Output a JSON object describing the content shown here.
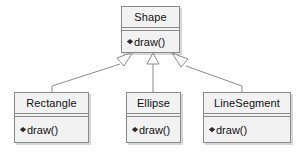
{
  "diagram": {
    "type": "uml-class-diagram",
    "relationship_label": "generalization",
    "colors": {
      "box_fill": "#f2f2f2",
      "box_border": "#8a8a8a",
      "line": "#8a8a8a",
      "text": "#111111",
      "background": "#ffffff",
      "arrowhead_fill": "#ffffff"
    },
    "classes": [
      {
        "id": "shape",
        "name": "Shape",
        "role": "superclass",
        "members": [
          {
            "visibility_marker": "filled-diamond",
            "text": "draw()"
          }
        ]
      },
      {
        "id": "rectangle",
        "name": "Rectangle",
        "role": "subclass",
        "members": [
          {
            "visibility_marker": "filled-diamond",
            "text": "draw()"
          }
        ]
      },
      {
        "id": "ellipse",
        "name": "Ellipse",
        "role": "subclass",
        "members": [
          {
            "visibility_marker": "filled-diamond",
            "text": "draw()"
          }
        ]
      },
      {
        "id": "linesegment",
        "name": "LineSegment",
        "role": "subclass",
        "members": [
          {
            "visibility_marker": "filled-diamond",
            "text": "draw()"
          }
        ]
      }
    ],
    "relationships": [
      {
        "id": "rel-rectangle-shape",
        "kind": "generalization",
        "from": "Rectangle",
        "to": "Shape",
        "arrowhead": "hollow-triangle"
      },
      {
        "id": "rel-ellipse-shape",
        "kind": "generalization",
        "from": "Ellipse",
        "to": "Shape",
        "arrowhead": "hollow-triangle"
      },
      {
        "id": "rel-linesegment-shape",
        "kind": "generalization",
        "from": "LineSegment",
        "to": "Shape",
        "arrowhead": "hollow-triangle"
      }
    ]
  }
}
